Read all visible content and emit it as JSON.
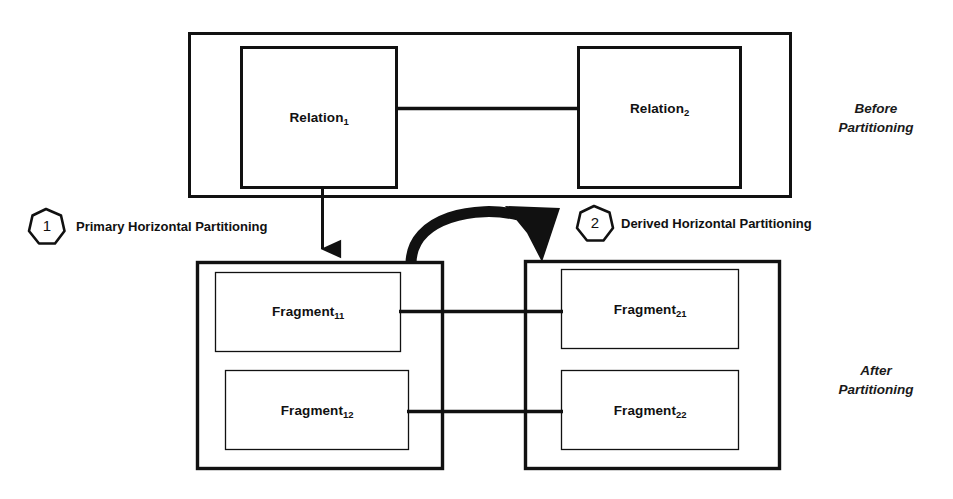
{
  "diagram": {
    "background_color": "#ffffff",
    "stroke_color": "#111111",
    "groups": [
      {
        "id": "before",
        "side_note": "Before\nPartitioning",
        "boxes": [
          {
            "id": "relation-1",
            "label_base": "Relation",
            "label_sub": "1"
          },
          {
            "id": "relation-2",
            "label_base": "Relation",
            "label_sub": "2"
          }
        ]
      },
      {
        "id": "after",
        "side_note": "After\nPartitioning",
        "boxes": [
          {
            "id": "fragment-11",
            "label_base": "Fragment",
            "label_sub": "11"
          },
          {
            "id": "fragment-12",
            "label_base": "Fragment",
            "label_sub": "12"
          },
          {
            "id": "fragment-21",
            "label_base": "Fragment",
            "label_sub": "21"
          },
          {
            "id": "fragment-22",
            "label_base": "Fragment",
            "label_sub": "22"
          }
        ]
      }
    ],
    "steps": [
      {
        "number": "1",
        "label": "Primary Horizontal Partitioning"
      },
      {
        "number": "2",
        "label": "Derived Horizontal Partitioning"
      }
    ]
  }
}
